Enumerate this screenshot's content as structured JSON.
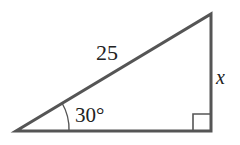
{
  "figure": {
    "type": "right-triangle",
    "stroke_color": "#555555",
    "hypotenuse_label": "25",
    "angle_label": "30°",
    "opposite_side_label": "x",
    "right_angle_marker": true
  }
}
